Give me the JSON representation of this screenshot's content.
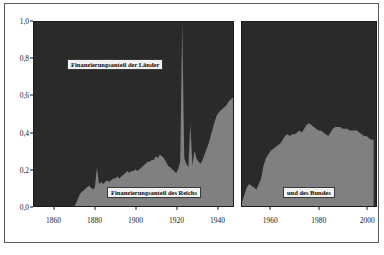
{
  "figure": {
    "title": "",
    "background_color": "#ffffff",
    "frame_color": "#5a5a5a"
  },
  "annotations": {
    "laender_label": "Finanzierungsanteil der Länder",
    "reich_label": "Finanzierungsanteil des Reichs",
    "bund_label": "und des Bundes"
  },
  "chart_data": {
    "type": "area",
    "title": "",
    "xlabel": "",
    "ylabel": "",
    "stacked": true,
    "normalized": true,
    "grid": false,
    "legend_position": "inline-annotations",
    "ylim": [
      0.0,
      1.0
    ],
    "yticks": [
      0.0,
      0.2,
      0.4,
      0.6,
      0.8,
      1.0
    ],
    "ytick_labels": [
      "0,0",
      "0,2",
      "0,4",
      "0,6",
      "0,8",
      "1,0"
    ],
    "xticks": [
      1860,
      1880,
      1900,
      1920,
      1940,
      1960,
      1980,
      2000
    ],
    "xtick_labels": [
      "1860",
      "1880",
      "1900",
      "1920",
      "1940",
      "1960",
      "1980",
      "2000"
    ],
    "colors": {
      "laender": "#2a2a2a",
      "reich_bund": "#808080"
    },
    "series": [
      {
        "name": "Finanzierungsanteil des Reichs und des Bundes",
        "color": "#808080",
        "panels": [
          {
            "panel": "left",
            "xlim": [
              1850,
              1948
            ],
            "x": [
              1850,
              1855,
              1860,
              1865,
              1868,
              1870,
              1871,
              1872,
              1873,
              1874,
              1875,
              1876,
              1877,
              1878,
              1879,
              1880,
              1881,
              1882,
              1883,
              1884,
              1885,
              1886,
              1887,
              1888,
              1889,
              1890,
              1891,
              1892,
              1893,
              1894,
              1895,
              1896,
              1897,
              1898,
              1899,
              1900,
              1901,
              1902,
              1903,
              1904,
              1905,
              1906,
              1907,
              1908,
              1909,
              1910,
              1911,
              1912,
              1913,
              1914,
              1915,
              1916,
              1917,
              1918,
              1919,
              1920,
              1921,
              1922,
              1923,
              1924,
              1925,
              1926,
              1927,
              1928,
              1929,
              1930,
              1931,
              1932,
              1933,
              1934,
              1935,
              1936,
              1937,
              1938,
              1939,
              1940,
              1941,
              1942,
              1943,
              1944,
              1945,
              1946,
              1947,
              1948
            ],
            "y": [
              0.0,
              0.0,
              0.0,
              0.0,
              0.0,
              0.0,
              0.02,
              0.05,
              0.07,
              0.08,
              0.09,
              0.1,
              0.11,
              0.1,
              0.09,
              0.1,
              0.21,
              0.12,
              0.13,
              0.12,
              0.13,
              0.14,
              0.13,
              0.14,
              0.15,
              0.15,
              0.16,
              0.15,
              0.16,
              0.17,
              0.18,
              0.19,
              0.18,
              0.19,
              0.19,
              0.2,
              0.19,
              0.2,
              0.21,
              0.22,
              0.23,
              0.24,
              0.24,
              0.25,
              0.25,
              0.27,
              0.26,
              0.28,
              0.27,
              0.26,
              0.24,
              0.22,
              0.21,
              0.2,
              0.19,
              0.18,
              0.2,
              0.24,
              1.0,
              0.26,
              0.23,
              0.21,
              0.45,
              0.22,
              0.3,
              0.26,
              0.24,
              0.23,
              0.25,
              0.28,
              0.31,
              0.34,
              0.38,
              0.42,
              0.46,
              0.49,
              0.51,
              0.52,
              0.53,
              0.54,
              0.55,
              0.57,
              0.58,
              0.59
            ]
          },
          {
            "panel": "right",
            "xlim": [
              1948,
              2004
            ],
            "x": [
              1948,
              1950,
              1951,
              1952,
              1953,
              1954,
              1955,
              1956,
              1957,
              1958,
              1959,
              1960,
              1961,
              1962,
              1963,
              1964,
              1965,
              1966,
              1967,
              1968,
              1969,
              1970,
              1971,
              1972,
              1973,
              1974,
              1975,
              1976,
              1977,
              1978,
              1979,
              1980,
              1981,
              1982,
              1983,
              1984,
              1985,
              1986,
              1987,
              1988,
              1989,
              1990,
              1991,
              1992,
              1993,
              1994,
              1995,
              1996,
              1997,
              1998,
              1999,
              2000,
              2001,
              2002,
              2003
            ],
            "y": [
              0.02,
              0.1,
              0.12,
              0.11,
              0.1,
              0.09,
              0.12,
              0.15,
              0.22,
              0.26,
              0.28,
              0.3,
              0.31,
              0.32,
              0.33,
              0.34,
              0.36,
              0.38,
              0.39,
              0.38,
              0.39,
              0.39,
              0.4,
              0.41,
              0.4,
              0.42,
              0.44,
              0.45,
              0.44,
              0.43,
              0.42,
              0.41,
              0.41,
              0.4,
              0.39,
              0.38,
              0.4,
              0.42,
              0.43,
              0.43,
              0.43,
              0.42,
              0.42,
              0.42,
              0.41,
              0.41,
              0.41,
              0.41,
              0.4,
              0.39,
              0.38,
              0.38,
              0.37,
              0.36,
              0.36
            ]
          }
        ]
      },
      {
        "name": "Finanzierungsanteil der Länder",
        "color": "#2a2a2a",
        "note": "Complement to 1.0 of the lower series (stacked to full height)."
      }
    ]
  }
}
